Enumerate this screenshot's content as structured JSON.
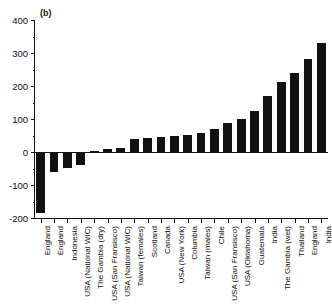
{
  "panel": {
    "label": "(b)"
  },
  "chart_data": {
    "type": "bar",
    "title": "(b)",
    "xlabel": "",
    "ylabel": "",
    "ylim": [
      -200,
      400
    ],
    "yticks": [
      -200,
      -100,
      0,
      100,
      200,
      300,
      400
    ],
    "ytick_labels": [
      "-200",
      "-100",
      "0",
      "100",
      "200",
      "300",
      "400"
    ],
    "grid": false,
    "legend": "none",
    "bar_color": "#111111",
    "categories": [
      "England",
      "England",
      "Indonesia",
      "USA (National WIC)",
      "The Gambia (dry)",
      "USA (San Fransisco)",
      "USA (National WIC)",
      "Taiwan (females)",
      "Scotland",
      "Canada",
      "USA (New York)",
      "Columbia",
      "Taiwan (males)",
      "Chile",
      "USA (San Fransisco)",
      "USA (Oklahoma)",
      "Guatemala",
      "India",
      "The Gambia (wet)",
      "Thailand",
      "England",
      "India"
    ],
    "values": [
      -185,
      -60,
      -48,
      -38,
      3,
      8,
      12,
      40,
      42,
      45,
      48,
      52,
      58,
      70,
      88,
      100,
      125,
      170,
      212,
      240,
      282,
      330
    ]
  }
}
